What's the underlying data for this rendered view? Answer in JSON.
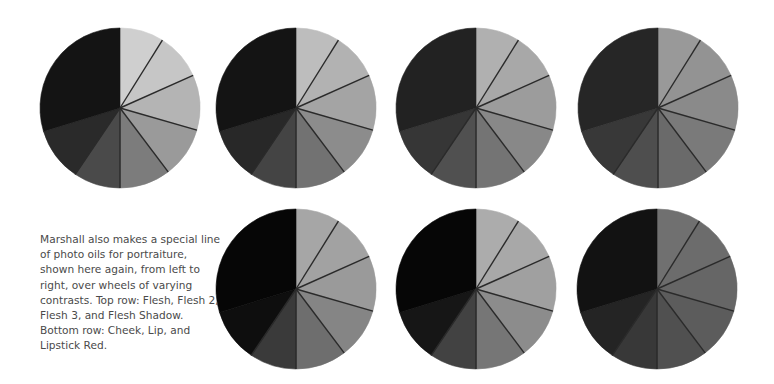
{
  "caption": {
    "lines": [
      "Marshall also makes a special line",
      "of photo oils for portraiture,",
      "shown here again, from left to",
      "right, over wheels of varying",
      "contrasts. Top row: Flesh, Flesh 2,",
      "Flesh 3, and Flesh Shadow.",
      "Bottom row: Cheek, Lip, and",
      "Lipstick Red."
    ]
  },
  "wheel_geometry": {
    "radius": 80,
    "boundaries_deg": [
      0,
      32,
      66,
      106,
      143,
      180,
      214,
      253,
      360
    ],
    "divider_lines_deg": [
      32,
      66,
      106,
      143,
      180,
      214
    ],
    "divider_color": "#2a2a2a"
  },
  "wheels": [
    {
      "name": "Flesh",
      "row": "top",
      "cx": 120,
      "cy": 108,
      "tones": [
        "#cfcfcf",
        "#c6c6c6",
        "#b4b4b4",
        "#9a9a9a",
        "#7c7c7c",
        "#4a4a4a",
        "#2a2a2a",
        "#141414"
      ]
    },
    {
      "name": "Flesh 2",
      "row": "top",
      "cx": 296,
      "cy": 108,
      "tones": [
        "#bdbdbd",
        "#b2b2b2",
        "#a4a4a4",
        "#8c8c8c",
        "#727272",
        "#444444",
        "#282828",
        "#141414"
      ]
    },
    {
      "name": "Flesh 3",
      "row": "top",
      "cx": 476,
      "cy": 108,
      "tones": [
        "#b0b0b0",
        "#a8a8a8",
        "#9c9c9c",
        "#888888",
        "#747474",
        "#505050",
        "#363636",
        "#222222"
      ]
    },
    {
      "name": "Flesh Shadow",
      "row": "top",
      "cx": 658,
      "cy": 108,
      "tones": [
        "#999999",
        "#939393",
        "#8a8a8a",
        "#7a7a7a",
        "#6a6a6a",
        "#4e4e4e",
        "#383838",
        "#262626"
      ]
    },
    {
      "name": "Cheek",
      "row": "bottom",
      "cx": 296,
      "cy": 289,
      "tones": [
        "#a6a6a6",
        "#a2a2a2",
        "#9a9a9a",
        "#858585",
        "#6e6e6e",
        "#3a3a3a",
        "#0e0e0e",
        "#060606"
      ]
    },
    {
      "name": "Lip",
      "row": "bottom",
      "cx": 476,
      "cy": 289,
      "tones": [
        "#acacac",
        "#a8a8a8",
        "#a0a0a0",
        "#8c8c8c",
        "#767676",
        "#424242",
        "#161616",
        "#060606"
      ]
    },
    {
      "name": "Lipstick Red",
      "row": "bottom",
      "cx": 657,
      "cy": 289,
      "tones": [
        "#707070",
        "#6c6c6c",
        "#666666",
        "#5c5c5c",
        "#505050",
        "#383838",
        "#242424",
        "#121212"
      ]
    }
  ]
}
